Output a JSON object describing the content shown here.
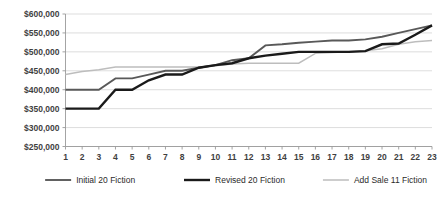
{
  "chart_data": {
    "type": "line",
    "title": "",
    "xlabel": "",
    "ylabel": "",
    "x": [
      1,
      2,
      3,
      4,
      5,
      6,
      7,
      8,
      9,
      10,
      11,
      12,
      13,
      14,
      15,
      16,
      17,
      18,
      19,
      20,
      21,
      22,
      23
    ],
    "xticklabels": [
      "1",
      "2",
      "3",
      "4",
      "5",
      "6",
      "7",
      "8",
      "9",
      "10",
      "11",
      "12",
      "13",
      "14",
      "15",
      "16",
      "17",
      "18",
      "19",
      "20",
      "21",
      "22",
      "23"
    ],
    "ylim": [
      250000,
      600000
    ],
    "yticks": [
      250000,
      300000,
      350000,
      400000,
      450000,
      500000,
      550000,
      600000
    ],
    "yticklabels": [
      "$250,000",
      "$300,000",
      "$350,000",
      "$400,000",
      "$450,000",
      "$500,000",
      "$550,000",
      "$600,000"
    ],
    "grid": true,
    "legend_position": "bottom",
    "series": [
      {
        "name": "Initial 20 Fiction",
        "color": "#595959",
        "width": 1.9,
        "values": [
          400000,
          400000,
          400000,
          430000,
          430000,
          440000,
          450000,
          450000,
          458000,
          465000,
          478000,
          483000,
          517000,
          520000,
          524000,
          527000,
          530000,
          530000,
          533000,
          540000,
          550000,
          560000,
          570000
        ]
      },
      {
        "name": "Revised 20 Fiction",
        "color": "#1a1a1a",
        "width": 2.4,
        "values": [
          350000,
          350000,
          350000,
          400000,
          400000,
          425000,
          440000,
          440000,
          458000,
          465000,
          470000,
          483000,
          490000,
          495000,
          500000,
          500000,
          500000,
          500000,
          502000,
          520000,
          522000,
          545000,
          570000
        ]
      },
      {
        "name": "Add Sale 11 Fiction",
        "color": "#bdbdbd",
        "width": 1.5,
        "values": [
          440000,
          448000,
          453000,
          460000,
          460000,
          460000,
          460000,
          460000,
          460000,
          463000,
          468000,
          470000,
          470000,
          470000,
          470000,
          496000,
          498000,
          500000,
          503000,
          508000,
          520000,
          527000,
          530000
        ]
      }
    ]
  },
  "legend": {
    "items": [
      {
        "label": "Initial 20 Fiction"
      },
      {
        "label": "Revised 20 Fiction"
      },
      {
        "label": "Add Sale 11 Fiction"
      }
    ]
  }
}
